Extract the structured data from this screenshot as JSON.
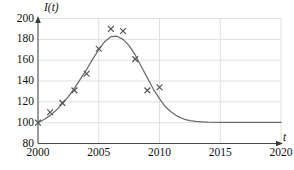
{
  "chart_data": {
    "type": "line",
    "title": "",
    "xlabel": "t",
    "ylabel": "I(t)",
    "xlim": [
      2000,
      2020
    ],
    "ylim": [
      80,
      200
    ],
    "xticks": [
      2000,
      2005,
      2010,
      2015,
      2020
    ],
    "yticks": [
      80,
      100,
      120,
      140,
      160,
      180,
      200
    ],
    "grid": true,
    "legend": "none",
    "series": [
      {
        "name": "model curve",
        "type": "line",
        "color": "#6b6b6b",
        "x": [
          2000,
          2000.5,
          2001,
          2001.5,
          2002,
          2002.5,
          2003,
          2003.5,
          2004,
          2004.5,
          2005,
          2005.5,
          2006,
          2006.5,
          2007,
          2007.5,
          2008,
          2008.5,
          2009,
          2009.5,
          2010,
          2010.5,
          2011,
          2011.5,
          2012,
          2012.5,
          2013,
          2013.5,
          2014,
          2015,
          2016,
          2017,
          2018,
          2019,
          2020
        ],
        "values": [
          100,
          103,
          107,
          112,
          118,
          125,
          133,
          142,
          151,
          161,
          170,
          178,
          182.5,
          183,
          180,
          174,
          165,
          154,
          143,
          132,
          123,
          115,
          110,
          106,
          103.5,
          102,
          101.2,
          100.8,
          100.5,
          100.3,
          100.2,
          100.2,
          100.2,
          100.2,
          100.2
        ]
      },
      {
        "name": "observed data",
        "type": "scatter",
        "marker": "x",
        "color": "#555555",
        "x": [
          2000,
          2001,
          2002,
          2003,
          2004,
          2005,
          2006,
          2007,
          2008,
          2009,
          2010
        ],
        "values": [
          100,
          110,
          119,
          131,
          147,
          171,
          190,
          188,
          161,
          131,
          134
        ]
      }
    ]
  },
  "axes": {
    "y_axis_name": "I(t)",
    "x_axis_name": "t",
    "y_tick_labels": [
      "200",
      "180",
      "160",
      "140",
      "120",
      "100",
      "80"
    ],
    "x_tick_labels": [
      "2000",
      "2005",
      "2010",
      "2015",
      "2020"
    ]
  }
}
